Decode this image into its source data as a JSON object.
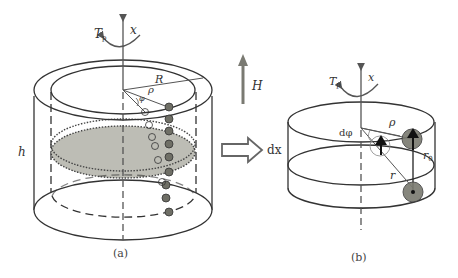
{
  "figure": {
    "panel_a": {
      "caption": "(a)",
      "labels": {
        "torque": "T",
        "torque_sub": "p",
        "axis": "x",
        "outer_radius": "R",
        "radius": "ρ",
        "angle": "φ",
        "height": "h"
      }
    },
    "transition": {
      "field_label": "H",
      "step_label": "dx"
    },
    "panel_b": {
      "caption": "(b)",
      "labels": {
        "torque": "T",
        "torque_sub": "p",
        "axis": "x",
        "radius": "ρ",
        "dphi": "dφ",
        "r0": "r",
        "r0_sub": "0",
        "r": "r"
      }
    },
    "colors": {
      "line": "#3a3a3a",
      "shaded_disk": "#b9b9b2",
      "ball": "#6f6f66",
      "arrow_gray": "#7a7a72"
    }
  }
}
